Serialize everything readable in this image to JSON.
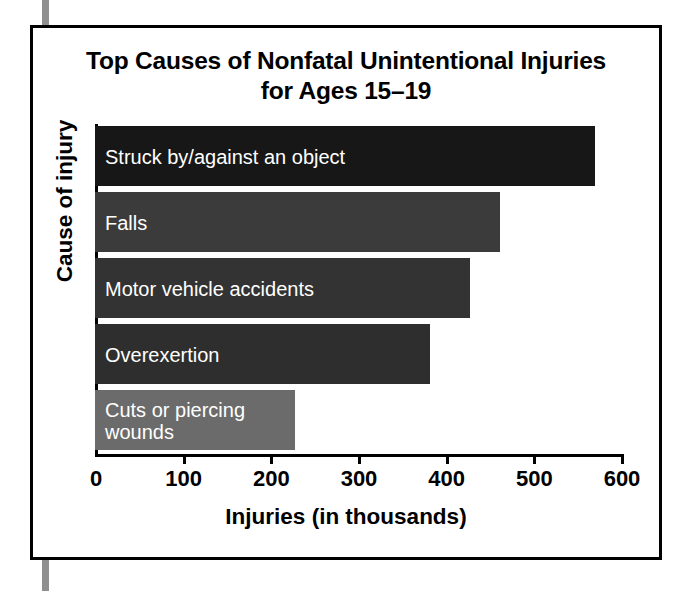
{
  "figure": {
    "frame_color": "#000000",
    "background": "#ffffff"
  },
  "title": {
    "line1": "Top Causes of Nonfatal Unintentional Injuries",
    "line2": "for Ages 15–19"
  },
  "axes": {
    "x_title": "Injuries (in thousands)",
    "y_title": "Cause of injury",
    "x_ticks": [
      "0",
      "100",
      "200",
      "300",
      "400",
      "500",
      "600"
    ],
    "x_tick_values": [
      0,
      100,
      200,
      300,
      400,
      500,
      600
    ],
    "x_min": 0,
    "x_max": 600
  },
  "chart_data": {
    "type": "bar",
    "orientation": "horizontal",
    "title": "Top Causes of Nonfatal Unintentional Injuries for Ages 15–19",
    "xlabel": "Injuries (in thousands)",
    "ylabel": "Cause of injury",
    "xlim": [
      0,
      600
    ],
    "grid": false,
    "legend": null,
    "categories": [
      "Struck by/against an object",
      "Falls",
      "Motor vehicle accidents",
      "Overexertion",
      "Cuts or piercing wounds"
    ],
    "values": [
      570,
      462,
      428,
      382,
      228
    ],
    "bar_colors": [
      "#171717",
      "#3b3b3b",
      "#333333",
      "#2e2e2e",
      "#6b6b6b"
    ],
    "label_color": "#ffffff",
    "bars": [
      {
        "label": "Struck by/against an object",
        "value": 570,
        "color": "#171717",
        "label_text": "Struck by/against an object"
      },
      {
        "label": "Falls",
        "value": 462,
        "color": "#3b3b3b",
        "label_text": "Falls"
      },
      {
        "label": "Motor vehicle accidents",
        "value": 428,
        "color": "#333333",
        "label_text": "Motor vehicle accidents"
      },
      {
        "label": "Overexertion",
        "value": 382,
        "color": "#2e2e2e",
        "label_text": "Overexertion"
      },
      {
        "label": "Cuts or piercing wounds",
        "value": 228,
        "color": "#6b6b6b",
        "label_text": "Cuts or piercing\nwounds"
      }
    ]
  }
}
